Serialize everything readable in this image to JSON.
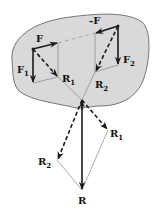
{
  "diagram": {
    "colors": {
      "body_fill": "#d9d9d9",
      "body_stroke": "#555555",
      "vector": "#1a1a1a",
      "thin_line": "#777777",
      "background": "#ffffff"
    },
    "labels": {
      "F": "F",
      "negF": "-F",
      "F1_main": "F",
      "F1_sub": "1",
      "F2_main": "F",
      "F2_sub": "2",
      "R1_main": "R",
      "R1_sub": "1",
      "R2_main": "R",
      "R2_sub": "2",
      "R1b_main": "R",
      "R1b_sub": "1",
      "R2b_main": "R",
      "R2b_sub": "2",
      "R": "R"
    },
    "points": {
      "A": [
        33,
        49
      ],
      "B": [
        118,
        26
      ],
      "O": [
        82,
        100
      ],
      "R_end": [
        82,
        190
      ],
      "R1_end": [
        108,
        130
      ],
      "R2_end": [
        57,
        160
      ]
    }
  }
}
